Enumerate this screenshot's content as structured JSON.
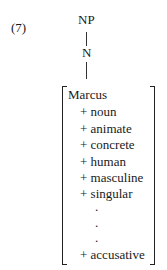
{
  "example_number": "(7)",
  "tree": {
    "root": "NP",
    "child": "N"
  },
  "feature_matrix": {
    "head": "Marcus",
    "features": [
      "+ noun",
      "+ animate",
      "+ concrete",
      "+ human",
      "+ masculine",
      "+ singular"
    ],
    "ellipsis": [
      ".",
      ".",
      "."
    ],
    "last_feature": "+ accusative"
  }
}
